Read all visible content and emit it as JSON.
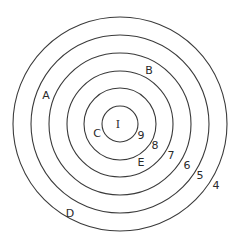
{
  "diagram": {
    "type": "concentric-circles",
    "center": {
      "x": 120,
      "y": 124
    },
    "stroke_color": "#3a3a3a",
    "background": "#ffffff",
    "rings": [
      {
        "index": 0,
        "radius": 18
      },
      {
        "index": 1,
        "radius": 36
      },
      {
        "index": 2,
        "radius": 53
      },
      {
        "index": 3,
        "radius": 71
      },
      {
        "index": 4,
        "radius": 89
      },
      {
        "index": 5,
        "radius": 107
      }
    ],
    "labels": {
      "center": "I",
      "c": "C",
      "n9": "9",
      "n8": "8",
      "e": "E",
      "n7": "7",
      "n6": "6",
      "n5": "5",
      "n4": "4",
      "b": "B",
      "a": "A",
      "d": "D"
    }
  }
}
